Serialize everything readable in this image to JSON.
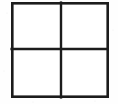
{
  "figure": {
    "name": "two-by-two-grid",
    "shape_type": "grid",
    "rows": 2,
    "columns": 2,
    "cell_count": 4,
    "background_color": "#fefefe",
    "stroke_color": "#1c1c1c",
    "stroke_width_outer": 2.6,
    "stroke_width_divider": 2.4,
    "bounds": {
      "left": 11,
      "top": 2,
      "right": 108,
      "bottom": 98,
      "width": 97,
      "height": 96
    },
    "dividers": {
      "vertical_x": 61,
      "horizontal_y": 49
    },
    "outer_rect": {
      "x": 12.3,
      "y": 3.3,
      "width": 95.4,
      "height": 93.4
    },
    "lines": [
      {
        "name": "top-edge",
        "x1": 11,
        "y1": 3.3,
        "x2": 108,
        "y2": 3.3
      },
      {
        "name": "bottom-edge",
        "x1": 11,
        "y1": 96.7,
        "x2": 108,
        "y2": 96.7
      },
      {
        "name": "left-edge",
        "x1": 12.3,
        "y1": 2,
        "x2": 12.3,
        "y2": 98
      },
      {
        "name": "right-edge",
        "x1": 106.7,
        "y1": 2,
        "x2": 106.7,
        "y2": 98
      },
      {
        "name": "vertical-divider",
        "x1": 61,
        "y1": 2.6,
        "x2": 61,
        "y2": 97.4
      },
      {
        "name": "horizontal-divider",
        "x1": 11.6,
        "y1": 49,
        "x2": 107.4,
        "y2": 49
      }
    ],
    "cells": [
      {
        "name": "cell-top-left",
        "label": "",
        "x": 13,
        "y": 4,
        "width": 47,
        "height": 44
      },
      {
        "name": "cell-top-right",
        "label": "",
        "x": 62,
        "y": 4,
        "width": 44,
        "height": 44
      },
      {
        "name": "cell-bottom-left",
        "label": "",
        "x": 13,
        "y": 50,
        "width": 47,
        "height": 46
      },
      {
        "name": "cell-bottom-right",
        "label": "",
        "x": 62,
        "y": 50,
        "width": 44,
        "height": 46
      }
    ],
    "specks": [
      {
        "x": 7,
        "y": 13,
        "r": 0.6
      },
      {
        "x": 4,
        "y": 71,
        "r": 0.5
      },
      {
        "x": 113,
        "y": 30,
        "r": 0.5
      },
      {
        "x": 95,
        "y": 101,
        "r": 0.6
      },
      {
        "x": 33,
        "y": 102,
        "r": 0.5
      },
      {
        "x": 26,
        "y": 20,
        "r": 0.5
      },
      {
        "x": 44,
        "y": 30,
        "r": 0.5
      },
      {
        "x": 78,
        "y": 68,
        "r": 0.5
      }
    ]
  }
}
